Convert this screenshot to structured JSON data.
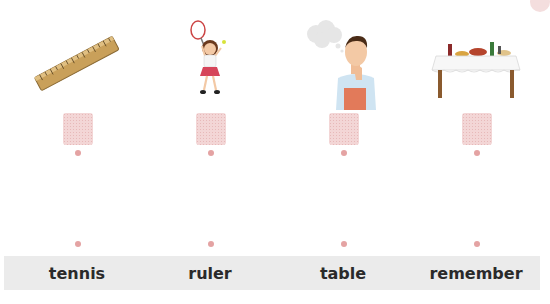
{
  "activity": {
    "columns": [
      {
        "picture": "ruler",
        "picture_icon": "ruler-icon"
      },
      {
        "picture": "girl playing tennis",
        "picture_icon": "tennis-player-icon"
      },
      {
        "picture": "man thinking",
        "picture_icon": "thinking-man-icon"
      },
      {
        "picture": "table with food",
        "picture_icon": "table-icon"
      }
    ],
    "words": [
      "tennis",
      "ruler",
      "table",
      "remember"
    ]
  },
  "colors": {
    "drop_box": "#f3d6d6",
    "dot": "#e4a3a3",
    "label_bar": "#ebebeb",
    "text": "#2a2a2a",
    "corner_badge": "#f4dede"
  }
}
